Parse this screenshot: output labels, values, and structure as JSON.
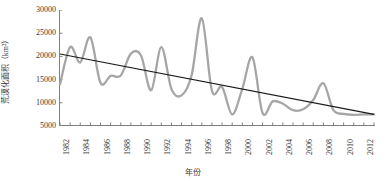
{
  "chart_data": {
    "type": "line",
    "title": "",
    "xlabel": "年份",
    "ylabel": "荒漠化面积（km²）",
    "xlim": [
      1982,
      2013
    ],
    "ylim": [
      5000,
      30000
    ],
    "yticks": [
      5000,
      10000,
      15000,
      20000,
      25000,
      30000
    ],
    "xticks": [
      1982,
      1984,
      1986,
      1988,
      1990,
      1992,
      1994,
      1996,
      1998,
      2000,
      2002,
      2004,
      2006,
      2008,
      2010,
      2012
    ],
    "xtick_labels": [
      "1982",
      "1984",
      "1986",
      "1988",
      "1990",
      "1992",
      "1994",
      "1996",
      "1998",
      "2000",
      "2002",
      "2004",
      "2006",
      "2008",
      "2010",
      "2012"
    ],
    "grid": false,
    "legend": "none",
    "x": [
      1982,
      1983,
      1984,
      1985,
      1986,
      1987,
      1988,
      1989,
      1990,
      1991,
      1992,
      1993,
      1994,
      1995,
      1996,
      1997,
      1998,
      1999,
      2000,
      2001,
      2002,
      2003,
      2004,
      2005,
      2006,
      2007,
      2008,
      2009,
      2010,
      2011,
      2012,
      2013
    ],
    "series": [
      {
        "name": "荒漠化面积",
        "color": "#a6a6a6",
        "style": "smooth-line",
        "values": [
          14000,
          22000,
          18700,
          24100,
          14300,
          15800,
          15900,
          20600,
          20200,
          12700,
          22000,
          13000,
          11600,
          16000,
          28200,
          12600,
          13400,
          7500,
          13000,
          19800,
          7800,
          10300,
          9800,
          8400,
          8600,
          10600,
          14200,
          8400,
          7600,
          7400,
          7500,
          7500
        ]
      },
      {
        "name": "线性趋势线",
        "color": "#1a1a1a",
        "style": "trend-line",
        "values": [
          20500,
          20081,
          19661,
          19242,
          18823,
          18403,
          17984,
          17565,
          17145,
          16726,
          16306,
          15887,
          15468,
          15048,
          14629,
          14210,
          13790,
          13371,
          12952,
          12532,
          12113,
          11694,
          11274,
          10855,
          10435,
          10016,
          9597,
          9177,
          8758,
          8339,
          7919,
          7500
        ]
      }
    ]
  }
}
